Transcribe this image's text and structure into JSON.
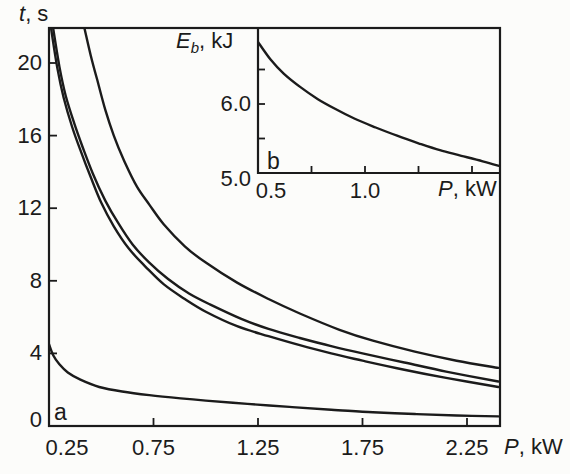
{
  "figure": {
    "background": "#fcfcfa",
    "line_color": "#1b1b1b",
    "panel_a_label": "a",
    "panel_b_label": "b"
  },
  "labels": {
    "main_y_var": "t",
    "main_y_unit": ", s",
    "main_x_var": "P",
    "main_x_unit": ", kW",
    "inset_y_var": "E",
    "inset_y_sub": "b",
    "inset_y_unit": ", kJ",
    "inset_x_var": "P",
    "inset_x_unit": ", kW"
  },
  "chart_data": [
    {
      "type": "line",
      "panel": "a",
      "title": "",
      "xlabel": "P, kW",
      "ylabel": "t, s",
      "xlim": [
        0.25,
        2.4
      ],
      "ylim": [
        0,
        21.9
      ],
      "grid": false,
      "legend": "none",
      "x_ticks": [
        {
          "value": 0.25,
          "label": "0.25",
          "corner": true
        },
        {
          "value": 0.75,
          "label": "0.75"
        },
        {
          "value": 1.25,
          "label": "1.25"
        },
        {
          "value": 1.75,
          "label": "1.75"
        },
        {
          "value": 2.25,
          "label": "2.25"
        }
      ],
      "y_ticks": [
        {
          "value": 0,
          "label": "0",
          "corner": true
        },
        {
          "value": 4,
          "label": "4"
        },
        {
          "value": 8,
          "label": "8"
        },
        {
          "value": 12,
          "label": "12"
        },
        {
          "value": 16,
          "label": "16"
        },
        {
          "value": 20,
          "label": "20"
        }
      ],
      "series": [
        {
          "name": "upper-curve",
          "points": [
            [
              0.42,
              21.9
            ],
            [
              0.45,
              20.4
            ],
            [
              0.48,
              19.1
            ],
            [
              0.52,
              17.4
            ],
            [
              0.56,
              16.0
            ],
            [
              0.61,
              14.6
            ],
            [
              0.67,
              13.2
            ],
            [
              0.73,
              12.2
            ],
            [
              0.8,
              11.1
            ],
            [
              0.9,
              9.9
            ],
            [
              1.0,
              9.0
            ],
            [
              1.15,
              7.9
            ],
            [
              1.3,
              7.0
            ],
            [
              1.45,
              6.2
            ],
            [
              1.64,
              5.3
            ],
            [
              1.8,
              4.7
            ],
            [
              2.0,
              4.1
            ],
            [
              2.2,
              3.6
            ],
            [
              2.4,
              3.2
            ]
          ]
        },
        {
          "name": "middle-upper-curve",
          "points": [
            [
              0.27,
              21.9
            ],
            [
              0.3,
              19.8
            ],
            [
              0.33,
              18.2
            ],
            [
              0.37,
              16.7
            ],
            [
              0.41,
              15.4
            ],
            [
              0.46,
              13.9
            ],
            [
              0.52,
              12.4
            ],
            [
              0.58,
              11.2
            ],
            [
              0.65,
              10.0
            ],
            [
              0.73,
              9.0
            ],
            [
              0.82,
              8.1
            ],
            [
              0.92,
              7.3
            ],
            [
              1.02,
              6.7
            ],
            [
              1.17,
              5.9
            ],
            [
              1.3,
              5.35
            ],
            [
              1.45,
              4.85
            ],
            [
              1.6,
              4.4
            ],
            [
              1.75,
              4.0
            ],
            [
              1.95,
              3.5
            ],
            [
              2.15,
              3.0
            ],
            [
              2.4,
              2.45
            ]
          ]
        },
        {
          "name": "middle-lower-curve",
          "points": [
            [
              0.26,
              21.9
            ],
            [
              0.29,
              19.7
            ],
            [
              0.32,
              18.1
            ],
            [
              0.36,
              16.5
            ],
            [
              0.4,
              15.2
            ],
            [
              0.45,
              13.7
            ],
            [
              0.5,
              12.3
            ],
            [
              0.56,
              11.0
            ],
            [
              0.63,
              9.8
            ],
            [
              0.71,
              8.8
            ],
            [
              0.8,
              7.8
            ],
            [
              0.9,
              7.0
            ],
            [
              1.0,
              6.3
            ],
            [
              1.15,
              5.5
            ],
            [
              1.3,
              4.95
            ],
            [
              1.45,
              4.45
            ],
            [
              1.6,
              4.0
            ],
            [
              1.75,
              3.6
            ],
            [
              1.95,
              3.1
            ],
            [
              2.15,
              2.65
            ],
            [
              2.4,
              2.15
            ]
          ]
        },
        {
          "name": "bottom-curve",
          "points": [
            [
              0.25,
              4.5
            ],
            [
              0.27,
              3.9
            ],
            [
              0.3,
              3.4
            ],
            [
              0.34,
              2.95
            ],
            [
              0.4,
              2.55
            ],
            [
              0.49,
              2.15
            ],
            [
              0.6,
              1.9
            ],
            [
              0.73,
              1.7
            ],
            [
              0.88,
              1.52
            ],
            [
              1.0,
              1.4
            ],
            [
              1.2,
              1.22
            ],
            [
              1.4,
              1.05
            ],
            [
              1.6,
              0.9
            ],
            [
              1.8,
              0.76
            ],
            [
              2.0,
              0.66
            ],
            [
              2.2,
              0.58
            ],
            [
              2.4,
              0.53
            ]
          ]
        }
      ]
    },
    {
      "type": "line",
      "panel": "b",
      "title": "",
      "xlabel": "P, kW",
      "ylabel": "Eb, kJ",
      "xlim": [
        0.5,
        1.63
      ],
      "ylim": [
        5.0,
        7.1
      ],
      "grid": false,
      "legend": "none",
      "x_ticks": [
        {
          "value": 0.5,
          "label": "0.5",
          "corner": true
        },
        {
          "value": 0.75
        },
        {
          "value": 1.0,
          "label": "1.0"
        },
        {
          "value": 1.25
        },
        {
          "value": 1.5
        }
      ],
      "y_ticks": [
        {
          "value": 5.0,
          "label": "5.0",
          "corner": true
        },
        {
          "value": 5.5
        },
        {
          "value": 6.0,
          "label": "6.0"
        },
        {
          "value": 6.5
        }
      ],
      "series": [
        {
          "name": "eb-curve",
          "points": [
            [
              0.5,
              6.9
            ],
            [
              0.56,
              6.64
            ],
            [
              0.62,
              6.44
            ],
            [
              0.7,
              6.24
            ],
            [
              0.78,
              6.07
            ],
            [
              0.86,
              5.93
            ],
            [
              0.95,
              5.79
            ],
            [
              1.05,
              5.66
            ],
            [
              1.15,
              5.54
            ],
            [
              1.25,
              5.43
            ],
            [
              1.35,
              5.33
            ],
            [
              1.45,
              5.25
            ],
            [
              1.55,
              5.17
            ],
            [
              1.63,
              5.1
            ]
          ]
        }
      ]
    }
  ]
}
